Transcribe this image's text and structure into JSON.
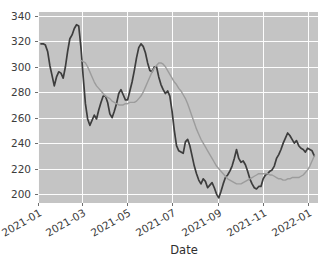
{
  "chart_data": {
    "type": "line",
    "title": "",
    "xlabel": "Date",
    "ylabel": "",
    "grid": true,
    "legend": "none",
    "background_color": "#c4c4c4",
    "gridline_color": "#fdfdfd",
    "ylim": [
      193,
      343
    ],
    "ytick_labels": [
      "200",
      "220",
      "240",
      "260",
      "280",
      "300",
      "320",
      "340"
    ],
    "ytick_values": [
      200,
      220,
      240,
      260,
      280,
      300,
      320,
      340
    ],
    "xtick_labels": [
      "2021-01",
      "2021-03",
      "2021-05",
      "2021-07",
      "2021-09",
      "2021-11",
      "2022-01"
    ],
    "xtick_positions": [
      0,
      59,
      120,
      181,
      243,
      304,
      365
    ],
    "xlim": [
      0,
      378
    ],
    "series": [
      {
        "name": "price",
        "color": "#3d3d3d",
        "line_width": 1.7,
        "x": [
          4,
          7,
          10,
          13,
          16,
          19,
          22,
          25,
          28,
          31,
          34,
          37,
          40,
          43,
          46,
          49,
          52,
          55,
          58,
          61,
          64,
          67,
          70,
          73,
          76,
          79,
          82,
          85,
          88,
          91,
          94,
          97,
          100,
          103,
          106,
          109,
          112,
          115,
          118,
          121,
          124,
          127,
          130,
          133,
          136,
          139,
          142,
          145,
          148,
          151,
          154,
          157,
          160,
          163,
          166,
          169,
          172,
          175,
          178,
          181,
          184,
          187,
          190,
          193,
          196,
          199,
          202,
          205,
          208,
          211,
          214,
          217,
          220,
          223,
          226,
          229,
          232,
          235,
          238,
          241,
          244,
          247,
          250,
          253,
          256,
          259,
          262,
          265,
          268,
          271,
          274,
          277,
          280,
          283,
          286,
          289,
          292,
          295,
          298,
          301,
          304,
          307,
          310,
          313,
          316,
          319,
          322,
          325,
          328,
          331,
          334,
          337,
          340,
          343,
          346,
          349,
          352,
          355,
          358,
          361,
          364,
          367,
          370,
          373
        ],
        "y": [
          318,
          318,
          317,
          312,
          301,
          293,
          285,
          292,
          296,
          295,
          291,
          300,
          312,
          322,
          325,
          330,
          333,
          332,
          315,
          292,
          271,
          259,
          254,
          258,
          262,
          259,
          266,
          272,
          277,
          277,
          272,
          263,
          260,
          265,
          271,
          279,
          282,
          278,
          274,
          274,
          281,
          288,
          297,
          307,
          315,
          318,
          316,
          311,
          303,
          297,
          296,
          300,
          300,
          292,
          286,
          282,
          279,
          281,
          277,
          265,
          250,
          238,
          234,
          233,
          232,
          241,
          243,
          238,
          230,
          222,
          216,
          211,
          208,
          212,
          210,
          205,
          207,
          209,
          205,
          200,
          197,
          202,
          208,
          213,
          215,
          218,
          222,
          228,
          235,
          228,
          225,
          226,
          223,
          218,
          212,
          208,
          205,
          204,
          206,
          206,
          212,
          215,
          216,
          218,
          219,
          222,
          228,
          231,
          235,
          240,
          244,
          248,
          246,
          243,
          240,
          242,
          238,
          236,
          235,
          233,
          236,
          235,
          234,
          230
        ]
      },
      {
        "name": "moving_average",
        "color": "#9c9c9c",
        "line_width": 1.4,
        "x": [
          58,
          61,
          64,
          67,
          70,
          73,
          76,
          79,
          82,
          85,
          88,
          91,
          94,
          97,
          100,
          103,
          106,
          109,
          112,
          115,
          118,
          121,
          124,
          127,
          130,
          133,
          136,
          139,
          142,
          145,
          148,
          151,
          154,
          157,
          160,
          163,
          166,
          169,
          172,
          175,
          178,
          181,
          184,
          187,
          190,
          193,
          196,
          199,
          202,
          205,
          208,
          211,
          214,
          217,
          220,
          223,
          226,
          229,
          232,
          235,
          238,
          241,
          244,
          247,
          250,
          253,
          256,
          259,
          262,
          265,
          268,
          271,
          274,
          277,
          280,
          283,
          286,
          289,
          292,
          295,
          298,
          301,
          304,
          307,
          310,
          313,
          316,
          319,
          322,
          325,
          328,
          331,
          334,
          337,
          340,
          343,
          346,
          349,
          352,
          355,
          358,
          361,
          364,
          367,
          370,
          373
        ],
        "y": [
          305,
          304,
          303,
          300,
          296,
          292,
          288,
          285,
          283,
          281,
          279,
          277,
          276,
          275,
          273,
          272,
          271,
          270,
          270,
          270,
          271,
          271,
          272,
          272,
          272,
          273,
          275,
          277,
          280,
          284,
          288,
          292,
          296,
          299,
          301,
          303,
          303,
          302,
          300,
          297,
          294,
          291,
          288,
          286,
          283,
          281,
          278,
          275,
          271,
          266,
          261,
          256,
          251,
          247,
          243,
          240,
          237,
          234,
          231,
          228,
          225,
          222,
          220,
          218,
          216,
          214,
          212,
          211,
          210,
          209,
          208,
          208,
          208,
          209,
          210,
          211,
          212,
          213,
          214,
          215,
          216,
          216,
          216,
          216,
          216,
          215,
          215,
          214,
          213,
          212,
          212,
          211,
          211,
          212,
          212,
          213,
          213,
          213,
          213,
          214,
          215,
          217,
          219,
          222,
          226,
          230
        ]
      }
    ]
  }
}
